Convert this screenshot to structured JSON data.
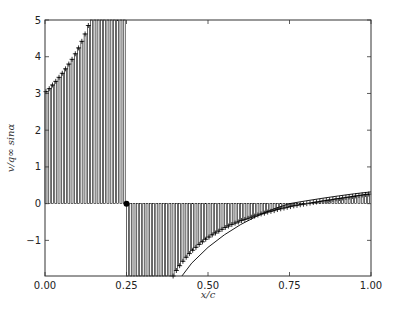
{
  "chart_data": {
    "type": "bar",
    "title": "",
    "xlabel": "x/c",
    "ylabel": "v/q∞ sinα",
    "xlim": [
      0.0,
      1.0
    ],
    "ylim": [
      -1.97,
      5.0
    ],
    "grid": false,
    "legend": null,
    "xticks": [
      "0.00",
      "0.25",
      "0.50",
      "0.75",
      "1.00"
    ],
    "xtick_values": [
      0.0,
      0.25,
      0.5,
      0.75,
      1.0
    ],
    "yticks": [
      "−1",
      "0",
      "1",
      "2",
      "3",
      "4",
      "5"
    ],
    "ytick_values": [
      -1,
      0,
      1,
      2,
      3,
      4,
      5
    ],
    "bar_width": 0.006,
    "bar_spacing": 0.01,
    "series": [
      {
        "name": "segment_1",
        "x_start": 0.0,
        "x_end": 0.24,
        "marker": "+",
        "values": [
          3.05,
          3.13,
          3.23,
          3.33,
          3.44,
          3.55,
          3.67,
          3.8,
          3.93,
          4.08,
          4.24,
          4.42,
          4.62,
          4.85,
          5.1,
          5.4,
          5.7,
          6.0,
          6.4,
          6.8,
          7.2,
          7.7,
          8.2,
          8.8,
          9.5
        ]
      },
      {
        "name": "segment_2",
        "x_start": 0.25,
        "x_end": 0.99,
        "marker": "+",
        "values": [
          -40,
          -20,
          -12,
          -8.5,
          -6.6,
          -5.4,
          -4.6,
          -4.0,
          -3.5,
          -3.1,
          -2.8,
          -2.55,
          -2.33,
          -2.14,
          -1.97,
          -1.82,
          -1.69,
          -1.57,
          -1.46,
          -1.36,
          -1.27,
          -1.19,
          -1.11,
          -1.04,
          -0.97,
          -0.91,
          -0.85,
          -0.8,
          -0.75,
          -0.7,
          -0.65,
          -0.61,
          -0.57,
          -0.53,
          -0.5,
          -0.46,
          -0.43,
          -0.4,
          -0.37,
          -0.34,
          -0.31,
          -0.28,
          -0.26,
          -0.23,
          -0.21,
          -0.19,
          -0.16,
          -0.14,
          -0.12,
          -0.1,
          -0.08,
          -0.06,
          -0.045,
          -0.03,
          -0.015,
          0.0,
          0.015,
          0.03,
          0.045,
          0.06,
          0.075,
          0.09,
          0.1,
          0.115,
          0.13,
          0.14,
          0.155,
          0.17,
          0.18,
          0.195,
          0.21,
          0.22,
          0.235,
          0.25,
          0.26
        ]
      }
    ],
    "curve": {
      "name": "analytic",
      "x": [
        0.42,
        0.45,
        0.5,
        0.55,
        0.6,
        0.65,
        0.7,
        0.75,
        0.8,
        0.85,
        0.9,
        0.95,
        1.0
      ],
      "y": [
        -1.97,
        -1.62,
        -1.19,
        -0.85,
        -0.57,
        -0.34,
        -0.15,
        0.0,
        0.075,
        0.145,
        0.21,
        0.27,
        0.32
      ]
    },
    "point": {
      "x": 0.25,
      "y": 0.0,
      "marker": "filled-circle"
    }
  }
}
